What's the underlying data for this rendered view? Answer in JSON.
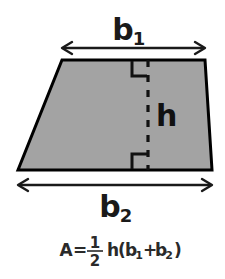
{
  "figure": {
    "title_alt": "Trapezoid area diagram",
    "background_color": "#ffffff",
    "shape": {
      "name": "trapezoid",
      "fill_color": "#a3a3a3",
      "stroke_color": "#000000",
      "stroke_width": 3,
      "vertices": [
        {
          "x": 62,
          "y": 60
        },
        {
          "x": 205,
          "y": 60
        },
        {
          "x": 212,
          "y": 170
        },
        {
          "x": 18,
          "y": 170
        }
      ]
    },
    "labels": {
      "top_base": {
        "base": "b",
        "subscript": "1"
      },
      "bottom_base": {
        "base": "b",
        "subscript": "2"
      },
      "height": "h"
    },
    "dimension_arrows": [
      {
        "name": "top-base-arrow",
        "measures": "b1",
        "x1": 62,
        "x2": 205,
        "y": 48,
        "double_headed": true,
        "color": "#1a1a1a"
      },
      {
        "name": "bottom-base-arrow",
        "measures": "b2",
        "x1": 18,
        "x2": 212,
        "y": 185,
        "double_headed": true,
        "color": "#1a1a1a"
      }
    ],
    "height_line": {
      "name": "height-dashed-line",
      "x": 148,
      "y1": 60,
      "y2": 170,
      "style": "dashed",
      "color": "#111111"
    },
    "right_angle_marks": [
      {
        "name": "right-angle-top",
        "corner_x": 148,
        "corner_y": 60,
        "size": 16,
        "position": "top"
      },
      {
        "name": "right-angle-bottom",
        "corner_x": 148,
        "corner_y": 170,
        "size": 16,
        "position": "bottom"
      }
    ],
    "formula": {
      "full_text": "A = 1/2 h(b1 + b2)",
      "area_symbol": "A",
      "equals": "=",
      "fraction_numerator": "1",
      "fraction_denominator": "2",
      "height_symbol": "h",
      "open_paren": "(",
      "term1_base": "b",
      "term1_sub": "1",
      "plus": "+",
      "term2_base": "b",
      "term2_sub": "2",
      "close_paren": ")"
    }
  }
}
